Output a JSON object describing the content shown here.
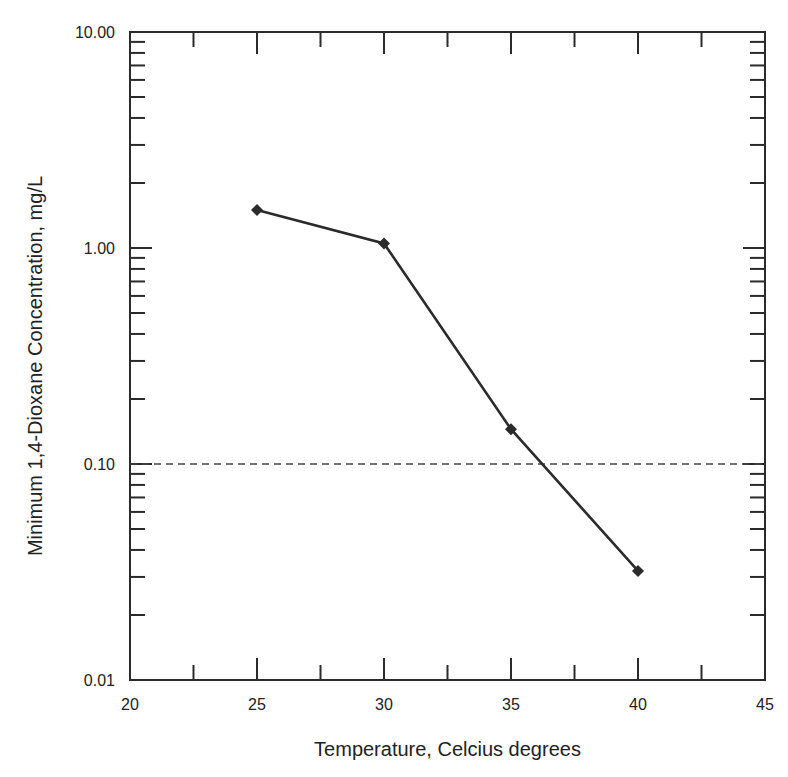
{
  "chart_data": {
    "type": "line",
    "title": "",
    "xlabel": "Temperature, Celcius degrees",
    "ylabel": "Minimum 1,4-Dioxane Concentration, mg/L",
    "x_scale": "linear",
    "y_scale": "log",
    "xlim": [
      20,
      45
    ],
    "ylim": [
      0.01,
      10
    ],
    "x_ticks": [
      20,
      25,
      30,
      35,
      40,
      45
    ],
    "x_tick_labels": [
      "20",
      "25",
      "30",
      "35",
      "40",
      "45"
    ],
    "x_minor_ticks": [
      22.5,
      27.5,
      32.5,
      37.5,
      42.5
    ],
    "y_ticks": [
      0.01,
      0.1,
      1,
      10
    ],
    "y_tick_labels": [
      "0.01",
      "0.10",
      "1.00",
      "10.00"
    ],
    "grid": false,
    "legend": "none",
    "series": [
      {
        "name": "Minimum concentration",
        "marker": "diamond",
        "color": "#2b2b2b",
        "x": [
          25,
          30,
          35,
          40
        ],
        "y": [
          1.5,
          1.05,
          0.145,
          0.032
        ]
      }
    ],
    "reference_lines": [
      {
        "orientation": "horizontal",
        "y": 0.1,
        "style": "dashed",
        "color": "#444444"
      }
    ],
    "colors": {
      "axis": "#2b2b2b",
      "line": "#2b2b2b",
      "reference": "#444444"
    }
  }
}
